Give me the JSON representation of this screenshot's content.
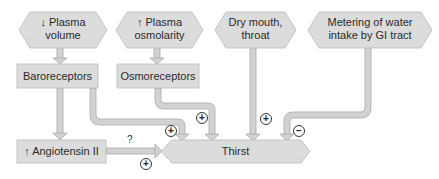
{
  "diagram": {
    "colors": {
      "box_fill": "#dcdcdc",
      "box_stroke": "#b8b8b8",
      "arrow_fill": "#d0d0d0",
      "arrow_stroke": "#a8a8a8",
      "background": "#ffffff"
    },
    "stimuli": [
      {
        "id": "plasma-volume",
        "label_line1": "↓ Plasma",
        "label_line2": "volume"
      },
      {
        "id": "plasma-osmolarity",
        "label_line1": "↑ Plasma",
        "label_line2": "osmolarity"
      },
      {
        "id": "dry-mouth",
        "label_line1": "Dry mouth,",
        "label_line2": "throat"
      },
      {
        "id": "gi-metering",
        "label_line1": "Metering of water",
        "label_line2": "intake by GI tract"
      }
    ],
    "receptors": [
      {
        "id": "baroreceptors",
        "label": "Baroreceptors"
      },
      {
        "id": "osmoreceptors",
        "label": "Osmoreceptors"
      }
    ],
    "angiotensin": {
      "label": "↑ Angiotensin II"
    },
    "target": {
      "label": "Thirst"
    },
    "effects": [
      {
        "from": "baroreceptors",
        "to": "thirst",
        "sign": "+"
      },
      {
        "from": "osmoreceptors",
        "to": "thirst",
        "sign": "+"
      },
      {
        "from": "dry-mouth",
        "to": "thirst",
        "sign": "+"
      },
      {
        "from": "gi-metering",
        "to": "thirst",
        "sign": "−"
      },
      {
        "from": "angiotensin",
        "to": "thirst",
        "sign": "+",
        "annotation": "?"
      }
    ],
    "signs": {
      "plus": "+",
      "minus": "−",
      "question": "?"
    }
  }
}
